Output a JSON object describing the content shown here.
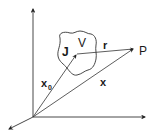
{
  "diagram": {
    "axes": [
      {
        "name": "z-axis",
        "direction": "up"
      },
      {
        "name": "y-axis",
        "direction": "right"
      },
      {
        "name": "x-axis",
        "direction": "down-left"
      }
    ],
    "labels": {
      "current_density": "J",
      "volume": "V",
      "separation": "r",
      "field_point": "P",
      "source_position": "x",
      "source_position_subscript": "0",
      "field_position": "x"
    },
    "colors": {
      "stroke": "#333333",
      "text": "#1a1a1a",
      "background": "#ffffff"
    }
  }
}
